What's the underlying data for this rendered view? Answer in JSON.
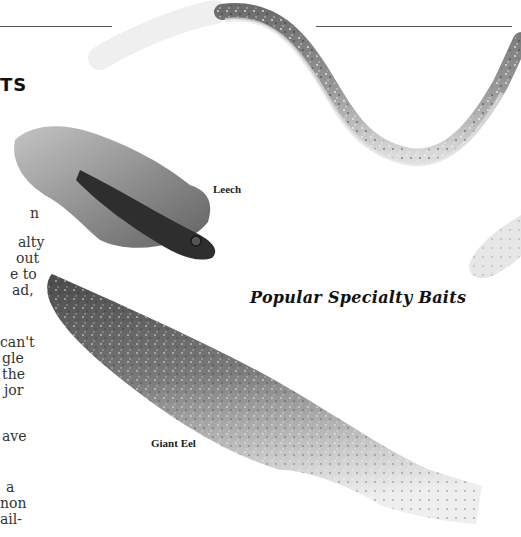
{
  "page": {
    "heading_fragment": "TS",
    "body_fragments": [
      {
        "text": "n",
        "top": 205
      },
      {
        "text": "alty",
        "top": 234
      },
      {
        "text": "out",
        "top": 250
      },
      {
        "text": "e to",
        "top": 266
      },
      {
        "text": "ad,",
        "top": 282
      },
      {
        "text": "can't",
        "top": 334
      },
      {
        "text": "gle",
        "top": 350
      },
      {
        "text": "the",
        "top": 366
      },
      {
        "text": "jor",
        "top": 382
      },
      {
        "text": "ave",
        "top": 428
      },
      {
        "text": "a",
        "top": 479
      },
      {
        "text": "non",
        "top": 495
      },
      {
        "text": "ail-",
        "top": 511
      }
    ],
    "figure": {
      "title": "Popular Specialty Baits",
      "captions": {
        "leech": "Leech",
        "giant_eel": "Giant Eel"
      },
      "images": [
        "curly-worm-photo",
        "leech-photo",
        "giant-eel-photo",
        "grub-tail-photo"
      ]
    }
  }
}
